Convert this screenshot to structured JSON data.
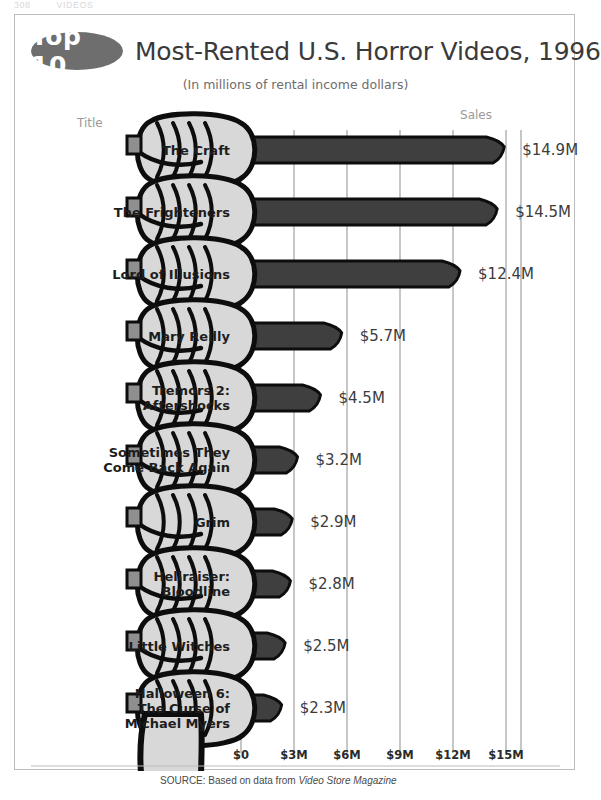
{
  "running_head": {
    "number": "308",
    "section": "VIDEOS"
  },
  "header": {
    "badge": "Top 10",
    "title": "Most-Rented U.S. Horror Videos, 1996",
    "subtitle": "(In millions of rental income dollars)"
  },
  "columns": {
    "title_header": "Title",
    "sales_header": "Sales"
  },
  "source": {
    "prefix": "SOURCE: Based on data from ",
    "italic": "Video Store Magazine"
  },
  "colors": {
    "badge_fill": "#6e6e6e",
    "blade_fill": "#3f3f3f",
    "handle_fill": "#9b9b9b",
    "hand_fill": "#d8d8d8",
    "outline": "#0d0d0d",
    "gridline": "#8e8e8e",
    "frame": "#bcbcbc",
    "text": "#2b2b2b",
    "muted_text": "#9a9a9a"
  },
  "chart_data": {
    "type": "bar",
    "orientation": "horizontal",
    "title": "Top 10 Most-Rented U.S. Horror Videos, 1996",
    "subtitle": "(In millions of rental income dollars)",
    "xlabel": "",
    "ylabel": "Title",
    "value_axis_label": "Sales",
    "categories": [
      "The Craft",
      "The Frighteners",
      "Lord of Illusions",
      "Mary Reilly",
      "Tremors 2: Aftershocks",
      "Sometimes They Come Back Again",
      "Grim",
      "Hellraiser: Bloodline",
      "Little Witches",
      "Halloween 6: The Curse of Michael Myers"
    ],
    "category_lines": [
      [
        "The Craft"
      ],
      [
        "The Frighteners"
      ],
      [
        "Lord of Illusions"
      ],
      [
        "Mary Reilly"
      ],
      [
        "Tremors 2:",
        "Aftershocks"
      ],
      [
        "Sometimes They",
        "Come Back Again"
      ],
      [
        "Grim"
      ],
      [
        "Hellraiser:",
        "Bloodline"
      ],
      [
        "Little Witches"
      ],
      [
        "Halloween 6:",
        "The Curse of",
        "Michael Myers"
      ]
    ],
    "values": [
      14.9,
      14.5,
      12.4,
      5.7,
      4.5,
      3.2,
      2.9,
      2.8,
      2.5,
      2.3
    ],
    "value_labels": [
      "$14.9M",
      "$14.5M",
      "$12.4M",
      "$5.7M",
      "$4.5M",
      "$3.2M",
      "$2.9M",
      "$2.8M",
      "$2.5M",
      "$2.3M"
    ],
    "xticks": [
      0,
      3,
      6,
      9,
      12,
      15
    ],
    "xtick_labels": [
      "$0",
      "$3M",
      "$6M",
      "$9M",
      "$12M",
      "$15M"
    ],
    "xlim": [
      0,
      17
    ],
    "grid": true,
    "legend": null,
    "units": "millions of rental income dollars",
    "year": 1996
  }
}
